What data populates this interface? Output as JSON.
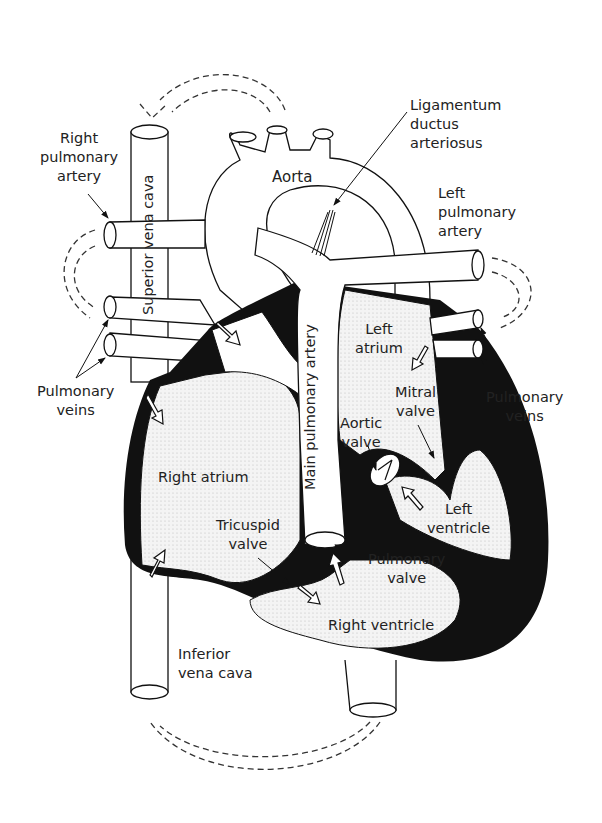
{
  "diagram": {
    "colors": {
      "outline": "#111111",
      "muscle": "#111111",
      "chamber_fill": "#f1f1f1",
      "background": "#ffffff",
      "flow_dashes": "#333333"
    },
    "labels": {
      "ligamentum": "Ligamentum\nductus\narteriosus",
      "right_pulmonary_artery": "Right\npulmonary\nartery",
      "aorta": "Aorta",
      "left_pulmonary_artery": "Left\npulmonary\nartery",
      "superior_vena_cava": "Superior vena cava",
      "main_pulmonary_artery": "Main pulmonary artery",
      "left_atrium": "Left\natrium",
      "pulmonary_veins_left": "Pulmonary\nveins",
      "pulmonary_veins_right": "Pulmonary\nveins",
      "mitral_valve": "Mitral\nvalve",
      "aortic_valve": "Aortic\nvalve",
      "right_atrium": "Right atrium",
      "left_ventricle": "Left\nventricle",
      "tricuspid_valve": "Tricuspid\nvalve",
      "pulmonary_valve": "Pulmonary\nvalve",
      "right_ventricle": "Right ventricle",
      "inferior_vena_cava": "Inferior\nvena cava"
    },
    "icons": {
      "flow_arrow": "hollow-block-arrow",
      "circulation_arrow": "dashed-curved-arrow",
      "pointer": "leader-line-arrow"
    }
  }
}
